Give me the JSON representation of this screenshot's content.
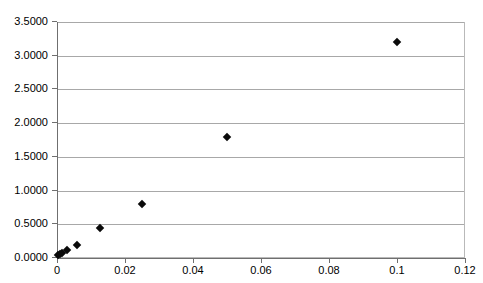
{
  "chart_data": {
    "type": "scatter",
    "title": "",
    "subtitle": "",
    "xlabel": "",
    "ylabel": "",
    "xlim": [
      0,
      0.12
    ],
    "ylim": [
      0,
      3.5
    ],
    "grid": true,
    "legend": false,
    "legend_position": "none",
    "marker": "diamond",
    "marker_color": "#0a0a0a",
    "x_ticks": [
      0,
      0.02,
      0.04,
      0.06,
      0.08,
      0.1,
      0.12
    ],
    "x_tick_labels": [
      "0",
      "0.02",
      "0.04",
      "0.06",
      "0.08",
      "0.1",
      "0.12"
    ],
    "y_ticks": [
      0,
      0.5,
      1.0,
      1.5,
      2.0,
      2.5,
      3.0,
      3.5
    ],
    "y_tick_labels": [
      "0.0000",
      "0.5000",
      "1.0000",
      "1.5000",
      "2.0000",
      "2.5000",
      "3.0000",
      "3.5000"
    ],
    "series": [
      {
        "name": "series-1",
        "points": [
          {
            "x": 0.0004,
            "y": 0.04
          },
          {
            "x": 0.0008,
            "y": 0.06
          },
          {
            "x": 0.0015,
            "y": 0.08
          },
          {
            "x": 0.003,
            "y": 0.12
          },
          {
            "x": 0.006,
            "y": 0.2
          },
          {
            "x": 0.0125,
            "y": 0.45
          },
          {
            "x": 0.025,
            "y": 0.8
          },
          {
            "x": 0.05,
            "y": 1.8
          },
          {
            "x": 0.1,
            "y": 3.2
          }
        ]
      }
    ]
  },
  "colors": {
    "background": "#ffffff",
    "gridline": "#a8a8a8",
    "axis": "#6f6f6f",
    "plot_border": "#b9b9b9",
    "marker": "#0a0a0a",
    "text": "#000000"
  }
}
